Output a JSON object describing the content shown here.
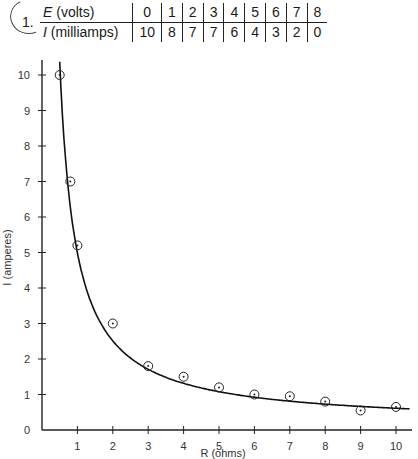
{
  "problem": {
    "number": "1."
  },
  "table": {
    "row_e": {
      "symbol": "E",
      "label": " (volts)",
      "values": [
        "0",
        "1",
        "2",
        "3",
        "4",
        "5",
        "6",
        "7",
        "8"
      ]
    },
    "row_i": {
      "symbol": "I",
      "label": " (milliamps)",
      "values": [
        "10",
        "8",
        "7",
        "7",
        "6",
        "4",
        "3",
        "2",
        "0"
      ]
    }
  },
  "chart_data": {
    "type": "scatter",
    "title": "",
    "xlabel": "R (ohms)",
    "ylabel": "I (amperes)",
    "xlim": [
      0,
      10
    ],
    "ylim": [
      0,
      10
    ],
    "x_ticks": [
      "1",
      "2",
      "3",
      "4",
      "5",
      "6",
      "7",
      "8",
      "9",
      "10"
    ],
    "y_ticks": [
      "0",
      "1",
      "2",
      "3",
      "4",
      "5",
      "6",
      "7",
      "8",
      "9",
      "10"
    ],
    "grid": false,
    "series": [
      {
        "name": "measured",
        "marker": "circled-dot",
        "x": [
          0.5,
          0.8,
          1,
          2,
          3,
          4,
          5,
          6,
          7,
          8,
          9,
          10
        ],
        "y": [
          10,
          7,
          5.2,
          3,
          1.8,
          1.5,
          1.2,
          1.0,
          0.95,
          0.8,
          0.55,
          0.65
        ]
      },
      {
        "name": "fit curve (I = k/R)",
        "style": "line",
        "k": 5.4
      }
    ]
  }
}
